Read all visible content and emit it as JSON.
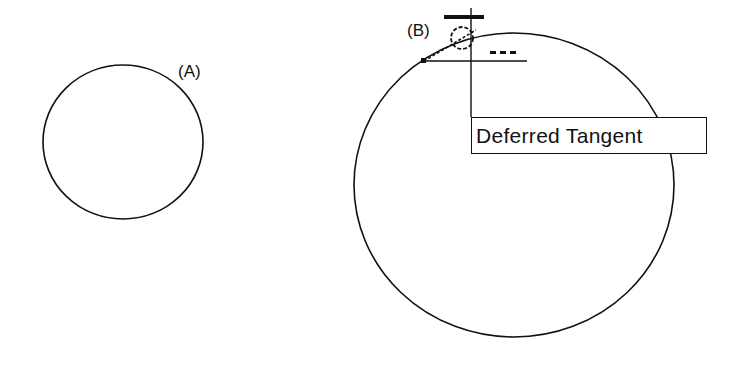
{
  "canvas": {
    "width": 741,
    "height": 367,
    "background": "#ffffff",
    "stroke": "#111111"
  },
  "circles": [
    {
      "id": "A",
      "label": "(A)",
      "cx": 123,
      "cy": 142,
      "rx": 80,
      "ry": 77
    },
    {
      "id": "B",
      "label": "(B)",
      "cx": 514,
      "cy": 185,
      "rx": 160,
      "ry": 152
    }
  ],
  "snap_marker": {
    "name": "deferred-tangent-marker",
    "tooltip": "Deferred Tangent"
  }
}
